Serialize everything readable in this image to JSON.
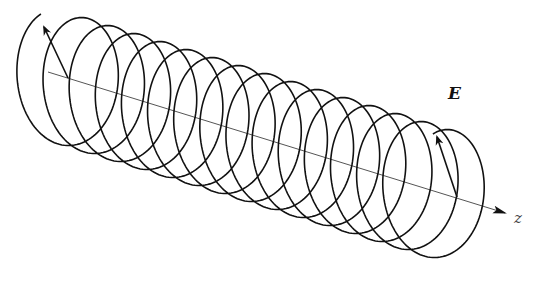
{
  "figure": {
    "labels": {
      "field": "E",
      "axis": "z"
    },
    "helix": {
      "turns": 15,
      "start_center": [
        56,
        76
      ],
      "end_center": [
        448,
        196
      ],
      "radius_x": 44,
      "radius_y": 66,
      "stroke": "#111111"
    },
    "axis": {
      "start": [
        48,
        72
      ],
      "end": [
        505,
        213
      ],
      "stroke": "#555555"
    },
    "vectors": [
      {
        "name": "start-field-vector",
        "from": [
          68,
          78
        ],
        "to": [
          44,
          27
        ]
      },
      {
        "name": "end-field-vector",
        "from": [
          457,
          197
        ],
        "to": [
          437,
          137
        ]
      }
    ]
  }
}
